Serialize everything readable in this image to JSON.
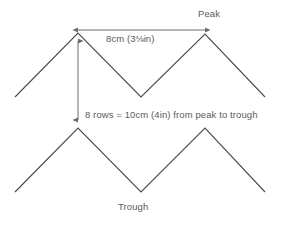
{
  "diagram": {
    "colors": {
      "background": "#ffffff",
      "line": "#4a4a4a",
      "dimension_line": "#6e6e6e",
      "text": "#5a5a5a"
    },
    "labels": {
      "peak": "Peak",
      "trough": "Trough",
      "width_measure": "8cm (3⅛in)",
      "height_measure": "8 rows = 10cm (4in) from peak to trough"
    },
    "measurements": {
      "peak_to_peak_cm": "8cm",
      "peak_to_peak_in": "3⅛in",
      "peak_to_trough_rows": "8 rows",
      "peak_to_trough_cm": "10cm",
      "peak_to_trough_in": "4in"
    },
    "geometry": {
      "top_zigzag_points": "15,97 78,33 141,97 205,34 265,97",
      "bottom_zigzag_points": "15,192 78,128 141,192 205,128 265,192",
      "horizontal_dimension": {
        "x1": 78,
        "x2": 205,
        "y": 30
      },
      "vertical_dimension": {
        "x": 78,
        "y1": 41,
        "y2": 120
      }
    }
  }
}
